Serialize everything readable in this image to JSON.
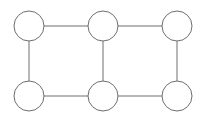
{
  "diagram": {
    "type": "graph",
    "width": 207,
    "height": 120,
    "stroke_color": "#6e6e6e",
    "fill_color": "#ffffff",
    "stroke_width": 1,
    "node_radius": 15,
    "nodes": [
      {
        "id": "n1",
        "label": "",
        "x": 29,
        "y": 26
      },
      {
        "id": "n2",
        "label": "",
        "x": 103,
        "y": 26
      },
      {
        "id": "n3",
        "label": "",
        "x": 177,
        "y": 26
      },
      {
        "id": "n4",
        "label": "",
        "x": 29,
        "y": 96
      },
      {
        "id": "n5",
        "label": "",
        "x": 103,
        "y": 96
      },
      {
        "id": "n6",
        "label": "",
        "x": 177,
        "y": 96
      }
    ],
    "edges": [
      {
        "from": "n1",
        "to": "n2"
      },
      {
        "from": "n2",
        "to": "n3"
      },
      {
        "from": "n4",
        "to": "n5"
      },
      {
        "from": "n5",
        "to": "n6"
      },
      {
        "from": "n1",
        "to": "n4"
      },
      {
        "from": "n2",
        "to": "n5"
      },
      {
        "from": "n3",
        "to": "n6"
      }
    ]
  }
}
